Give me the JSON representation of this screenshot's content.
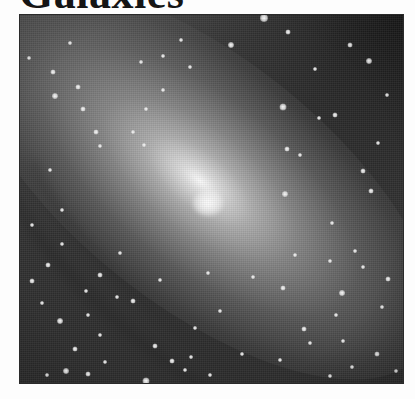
{
  "page": {
    "heading": "Galaxies"
  },
  "figure": {
    "core_position": {
      "x": 188,
      "y": 188
    },
    "stars": [
      {
        "x": 244,
        "y": 3,
        "r": 4
      },
      {
        "x": 211,
        "y": 30,
        "r": 3
      },
      {
        "x": 268,
        "y": 17,
        "r": 2.5
      },
      {
        "x": 330,
        "y": 30,
        "r": 2.5
      },
      {
        "x": 349,
        "y": 46,
        "r": 3
      },
      {
        "x": 295,
        "y": 54,
        "r": 2
      },
      {
        "x": 367,
        "y": 80,
        "r": 2
      },
      {
        "x": 315,
        "y": 100,
        "r": 2.5
      },
      {
        "x": 263,
        "y": 92,
        "r": 3.5
      },
      {
        "x": 267,
        "y": 134,
        "r": 2.5
      },
      {
        "x": 299,
        "y": 103,
        "r": 2
      },
      {
        "x": 343,
        "y": 156,
        "r": 2.5
      },
      {
        "x": 358,
        "y": 128,
        "r": 2
      },
      {
        "x": 265,
        "y": 179,
        "r": 3
      },
      {
        "x": 280,
        "y": 140,
        "r": 2
      },
      {
        "x": 351,
        "y": 176,
        "r": 2.5
      },
      {
        "x": 50,
        "y": 28,
        "r": 2
      },
      {
        "x": 33,
        "y": 57,
        "r": 2.5
      },
      {
        "x": 58,
        "y": 72,
        "r": 2.5
      },
      {
        "x": 9,
        "y": 43,
        "r": 2
      },
      {
        "x": 35,
        "y": 81,
        "r": 3
      },
      {
        "x": 63,
        "y": 94,
        "r": 2.5
      },
      {
        "x": 76,
        "y": 117,
        "r": 2.5
      },
      {
        "x": 80,
        "y": 131,
        "r": 2
      },
      {
        "x": 113,
        "y": 117,
        "r": 2
      },
      {
        "x": 126,
        "y": 94,
        "r": 2
      },
      {
        "x": 143,
        "y": 75,
        "r": 2
      },
      {
        "x": 121,
        "y": 47,
        "r": 2
      },
      {
        "x": 143,
        "y": 41,
        "r": 2
      },
      {
        "x": 161,
        "y": 25,
        "r": 2
      },
      {
        "x": 170,
        "y": 52,
        "r": 2
      },
      {
        "x": 124,
        "y": 130,
        "r": 2
      },
      {
        "x": 30,
        "y": 155,
        "r": 2
      },
      {
        "x": 42,
        "y": 195,
        "r": 2
      },
      {
        "x": 12,
        "y": 210,
        "r": 2
      },
      {
        "x": 28,
        "y": 250,
        "r": 2.5
      },
      {
        "x": 12,
        "y": 266,
        "r": 2.5
      },
      {
        "x": 22,
        "y": 288,
        "r": 2
      },
      {
        "x": 40,
        "y": 306,
        "r": 3
      },
      {
        "x": 66,
        "y": 276,
        "r": 2
      },
      {
        "x": 68,
        "y": 300,
        "r": 2
      },
      {
        "x": 80,
        "y": 260,
        "r": 2.5
      },
      {
        "x": 97,
        "y": 282,
        "r": 2
      },
      {
        "x": 113,
        "y": 286,
        "r": 2.5
      },
      {
        "x": 80,
        "y": 320,
        "r": 2
      },
      {
        "x": 55,
        "y": 334,
        "r": 2.5
      },
      {
        "x": 85,
        "y": 347,
        "r": 2
      },
      {
        "x": 27,
        "y": 360,
        "r": 2
      },
      {
        "x": 46,
        "y": 356,
        "r": 3
      },
      {
        "x": 68,
        "y": 359,
        "r": 2.5
      },
      {
        "x": 96,
        "y": 370,
        "r": 2
      },
      {
        "x": 126,
        "y": 366,
        "r": 3.5
      },
      {
        "x": 135,
        "y": 331,
        "r": 2.5
      },
      {
        "x": 152,
        "y": 346,
        "r": 2.5
      },
      {
        "x": 165,
        "y": 355,
        "r": 2
      },
      {
        "x": 171,
        "y": 342,
        "r": 2
      },
      {
        "x": 190,
        "y": 360,
        "r": 2
      },
      {
        "x": 222,
        "y": 339,
        "r": 2
      },
      {
        "x": 260,
        "y": 345,
        "r": 2
      },
      {
        "x": 290,
        "y": 328,
        "r": 2
      },
      {
        "x": 310,
        "y": 361,
        "r": 2
      },
      {
        "x": 332,
        "y": 352,
        "r": 2
      },
      {
        "x": 357,
        "y": 339,
        "r": 2.5
      },
      {
        "x": 376,
        "y": 356,
        "r": 2
      },
      {
        "x": 362,
        "y": 292,
        "r": 2
      },
      {
        "x": 316,
        "y": 300,
        "r": 2
      },
      {
        "x": 323,
        "y": 326,
        "r": 2
      },
      {
        "x": 284,
        "y": 314,
        "r": 2.5
      },
      {
        "x": 343,
        "y": 252,
        "r": 2
      },
      {
        "x": 368,
        "y": 264,
        "r": 2.5
      },
      {
        "x": 322,
        "y": 278,
        "r": 3
      },
      {
        "x": 310,
        "y": 246,
        "r": 2
      },
      {
        "x": 335,
        "y": 236,
        "r": 2
      },
      {
        "x": 263,
        "y": 273,
        "r": 2.5
      },
      {
        "x": 275,
        "y": 240,
        "r": 2
      },
      {
        "x": 312,
        "y": 208,
        "r": 2
      },
      {
        "x": 42,
        "y": 229,
        "r": 2
      },
      {
        "x": 100,
        "y": 238,
        "r": 2
      },
      {
        "x": 140,
        "y": 265,
        "r": 2
      },
      {
        "x": 175,
        "y": 313,
        "r": 2
      },
      {
        "x": 200,
        "y": 296,
        "r": 2
      },
      {
        "x": 233,
        "y": 262,
        "r": 2
      },
      {
        "x": 188,
        "y": 258,
        "r": 2
      }
    ]
  }
}
